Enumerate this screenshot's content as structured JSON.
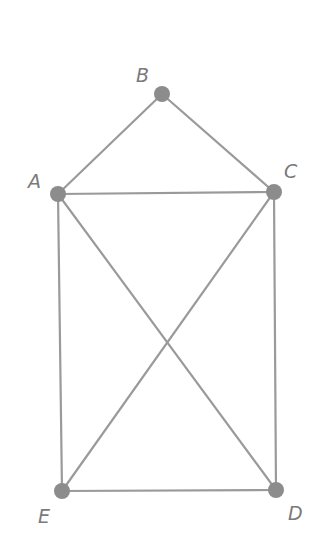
{
  "diagram": {
    "type": "graph",
    "colors": {
      "edge": "#9a9a9a",
      "node": "#8c8c8c",
      "label": "#7a7a7a",
      "background": "#ffffff"
    },
    "nodes": [
      {
        "id": "A",
        "label": "A",
        "x": 58,
        "y": 194,
        "lx": 28,
        "ly": 188
      },
      {
        "id": "B",
        "label": "B",
        "x": 162,
        "y": 94,
        "lx": 136,
        "ly": 82
      },
      {
        "id": "C",
        "label": "C",
        "x": 274,
        "y": 192,
        "lx": 284,
        "ly": 178
      },
      {
        "id": "D",
        "label": "D",
        "x": 276,
        "y": 490,
        "lx": 288,
        "ly": 520
      },
      {
        "id": "E",
        "label": "E",
        "x": 62,
        "y": 491,
        "lx": 38,
        "ly": 523
      }
    ],
    "edges": [
      [
        "A",
        "B"
      ],
      [
        "B",
        "C"
      ],
      [
        "A",
        "C"
      ],
      [
        "A",
        "E"
      ],
      [
        "A",
        "D"
      ],
      [
        "C",
        "D"
      ],
      [
        "C",
        "E"
      ],
      [
        "E",
        "D"
      ]
    ]
  }
}
